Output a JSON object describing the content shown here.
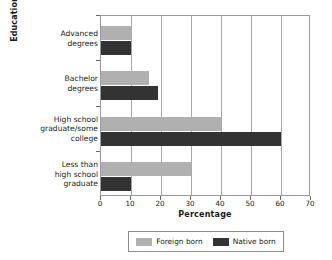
{
  "chart_data": {
    "type": "bar",
    "orientation": "horizontal",
    "title": "",
    "xlabel": "Percentage",
    "ylabel": "Education",
    "xlim": [
      0,
      70
    ],
    "xticks": [
      0,
      10,
      20,
      30,
      40,
      50,
      60,
      70
    ],
    "grid": "vertical",
    "legend_position": "bottom",
    "categories": [
      "Less than high school graduate",
      "High school graduate/some college",
      "Bachelor degrees",
      "Advanced degrees"
    ],
    "category_lines": [
      [
        "Less than",
        "high school",
        "graduate"
      ],
      [
        "High school",
        "graduate/some",
        "college"
      ],
      [
        "Bachelor",
        "degrees"
      ],
      [
        "Advanced",
        "degrees"
      ]
    ],
    "series": [
      {
        "name": "Foreign born",
        "color": "#b0b0b0",
        "values": [
          30,
          40,
          16,
          10
        ]
      },
      {
        "name": "Native born",
        "color": "#333333",
        "values": [
          10,
          60,
          19,
          10
        ]
      }
    ]
  },
  "axes": {
    "y_title": "Education",
    "x_title": "Percentage"
  },
  "colors": {
    "foreign_born": "#b0b0b0",
    "native_born": "#333333",
    "axis": "#9a9a9a",
    "grid": "#a8a8a8",
    "background": "#ffffff"
  }
}
